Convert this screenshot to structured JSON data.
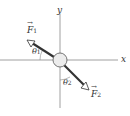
{
  "diagram": {
    "axes": {
      "x_label": "x",
      "y_label": "y"
    },
    "forces": [
      {
        "symbol": "F",
        "subscript": "1",
        "direction": "upper-left"
      },
      {
        "symbol": "F",
        "subscript": "2",
        "direction": "lower-right"
      }
    ],
    "angles": [
      {
        "symbol": "θ",
        "subscript": "1",
        "between": "F1 and negative x-axis"
      },
      {
        "symbol": "θ",
        "subscript": "2",
        "between": "F2 and negative y-axis"
      }
    ],
    "colors": {
      "axis": "#888888",
      "arrow": "#333333",
      "circle_fill": "#e8e8e8",
      "circle_stroke": "#555555"
    }
  }
}
